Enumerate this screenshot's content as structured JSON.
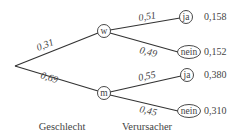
{
  "diagram": {
    "type": "probability-tree",
    "levels": {
      "level1_label": "Geschlecht",
      "level2_label": "Verursacher"
    },
    "branches": {
      "w": {
        "node": "w",
        "prob": "0,31",
        "children": {
          "ja": {
            "node": "ja",
            "prob": "0,51",
            "result": "0,158"
          },
          "nein": {
            "node": "nein",
            "prob": "0,49",
            "result": "0,152"
          }
        }
      },
      "m": {
        "node": "m",
        "prob": "0,69",
        "children": {
          "ja": {
            "node": "ja",
            "prob": "0,55",
            "result": "0,380"
          },
          "nein": {
            "node": "nein",
            "prob": "0,45",
            "result": "0,310"
          }
        }
      }
    }
  }
}
